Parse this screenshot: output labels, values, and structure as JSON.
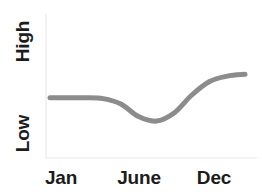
{
  "chart_data": {
    "type": "line",
    "title": "",
    "subtitle": "",
    "xlabel": "",
    "ylabel": "",
    "grid": false,
    "legend": false,
    "legend_position": "none",
    "x_tick_labels": [
      "Jan",
      "June",
      "Dec"
    ],
    "y_tick_labels": [
      "Low",
      "High"
    ],
    "xlim": [
      "Jan",
      "Dec"
    ],
    "ylim": [
      "Low",
      "High"
    ],
    "annotations": [],
    "series": [
      {
        "name": "trend",
        "color": "#8c8c8c",
        "line_width": 5,
        "x": [
          "Jan",
          "Feb",
          "Mar",
          "Apr",
          "May",
          "June",
          "July",
          "Aug",
          "Sept",
          "Oct",
          "Nov",
          "Dec"
        ],
        "values": [
          0.47,
          0.47,
          0.47,
          0.46,
          0.4,
          0.26,
          0.21,
          0.3,
          0.5,
          0.65,
          0.71,
          0.73
        ]
      }
    ]
  },
  "axis": {
    "y_high_label": "High",
    "y_low_label": "Low",
    "x_start_label": "Jan",
    "x_middle_label": "June",
    "x_end_label": "Dec"
  },
  "colors": {
    "line": "#8c8c8c",
    "text": "#1c1c1c",
    "axis": "#f3f3f3",
    "background": "#ffffff"
  }
}
